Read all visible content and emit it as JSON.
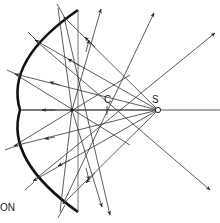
{
  "diagram": {
    "type": "concave-mirror-ray-diagram",
    "labels": {
      "center_of_curvature": "C",
      "source": "S",
      "caption_fragment": "ON"
    },
    "colors": {
      "background": "#ffffff",
      "mirror": "#111111",
      "rays": "#333333",
      "axis": "#444444"
    },
    "points": {
      "source_S": [
        158,
        110
      ],
      "center_C": [
        107,
        110
      ],
      "image_point": [
        72,
        110
      ]
    },
    "mirror": {
      "top_end": [
        78,
        10
      ],
      "bottom_end": [
        78,
        212
      ],
      "vertex": [
        20,
        110
      ]
    }
  }
}
